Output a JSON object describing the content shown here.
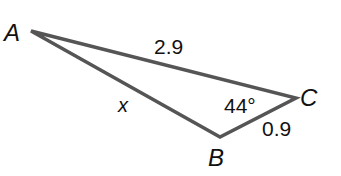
{
  "figure": {
    "type": "triangle",
    "vertices": {
      "A": {
        "label": "A",
        "x": 31,
        "y": 31
      },
      "B": {
        "label": "B",
        "x": 220,
        "y": 137
      },
      "C": {
        "label": "C",
        "x": 296,
        "y": 98
      }
    },
    "sides": {
      "AC": {
        "label": "2.9"
      },
      "BC": {
        "label": "0.9"
      },
      "AB": {
        "label": "x"
      }
    },
    "angles": {
      "C": {
        "label": "44°"
      }
    },
    "colors": {
      "stroke": "#555555",
      "text": "#111111",
      "background": "#ffffff"
    }
  }
}
